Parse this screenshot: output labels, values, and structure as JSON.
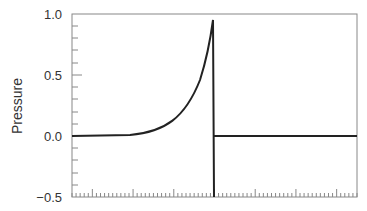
{
  "chart_data": {
    "type": "line",
    "title": "",
    "xlabel": "",
    "ylabel": "Pressure",
    "ylim": [
      -0.5,
      1.0
    ],
    "yticks": [
      "1.0",
      "0.5",
      "0.0",
      "−0.5"
    ],
    "grid": false,
    "series": [
      {
        "name": "pressure pulse",
        "description": "exponential rise from 0 to ~0.95 then instantaneous drop to below -0.5 and return to 0",
        "x": [
          0,
          0.2,
          0.3,
          0.4,
          0.45,
          0.48,
          0.5,
          0.5,
          0.5,
          1.0
        ],
        "y": [
          0,
          0.01,
          0.05,
          0.15,
          0.3,
          0.55,
          0.95,
          -0.5,
          0,
          0
        ]
      }
    ]
  }
}
